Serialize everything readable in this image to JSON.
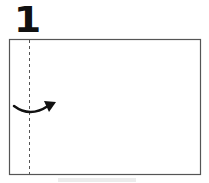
{
  "step": {
    "number": "1"
  },
  "diagram": {
    "paper": {
      "x": 9.5,
      "y": 39.5,
      "width": 191,
      "height": 135,
      "stroke": "#555555"
    },
    "fold_line": {
      "x": 29.5,
      "y1": 39.5,
      "y2": 174.5,
      "style": "valley-fold-dashed",
      "stroke": "#555555"
    },
    "arrow": {
      "type": "curved-fold-arrow",
      "direction": "right",
      "color": "#111111"
    }
  }
}
